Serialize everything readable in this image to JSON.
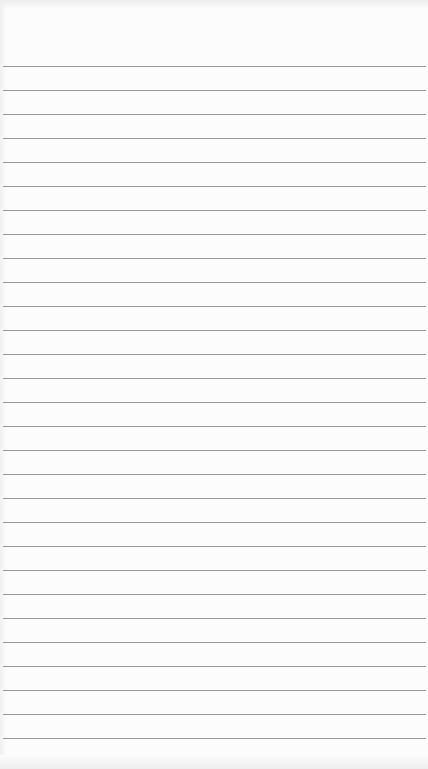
{
  "paper": {
    "type": "lined-notepad-sheet",
    "background_color": "#fcfcfc",
    "line_color": "#8e8e8e",
    "first_line_y": 66,
    "line_spacing": 24,
    "line_count": 29,
    "text_content": ""
  }
}
